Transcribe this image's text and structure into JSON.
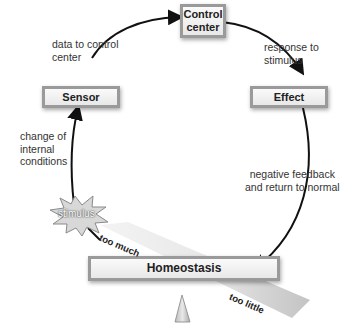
{
  "diagram": {
    "nodes": {
      "control_center": "Control center",
      "control_center_line1": "Control",
      "control_center_line2": "center",
      "sensor": "Sensor",
      "effect": "Effect",
      "homeostasis": "Homeostasis",
      "stimulus": "stimulus"
    },
    "edge_labels": {
      "sensor_to_control_line1": "data to control",
      "sensor_to_control_line2": "center",
      "control_to_effect_line1": "response to",
      "control_to_effect_line2": "stimulus",
      "stimulus_to_sensor_line1": "change of",
      "stimulus_to_sensor_line2": "internal",
      "stimulus_to_sensor_line3": "conditions",
      "effect_to_homeostasis_line1": "negative feedback",
      "effect_to_homeostasis_line2": "and return to normal"
    },
    "balance_labels": {
      "too_much": "too much",
      "too_little": "too little"
    },
    "colors": {
      "box_border": "#9a9a9a",
      "box_fill": "#efefef",
      "arrow": "#111111",
      "stimulus_fill": "#d8d8d8"
    }
  }
}
